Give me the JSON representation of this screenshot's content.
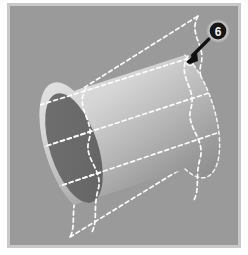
{
  "figure": {
    "caption_label": "6",
    "background_color": "#ffffff",
    "canvas_color": "#9a9a9a",
    "canvas_border_color": "#c9c9c9",
    "canvas": {
      "x": 10,
      "y": 6,
      "width": 228,
      "height": 239
    }
  },
  "colors": {
    "page_background": "#ffffff",
    "plot_background": "#9a9a9a",
    "cylinder_cap_dark": "#6b6b6b",
    "cylinder_body_light": "#d8d8d8",
    "cylinder_body_mid": "#b4b4b4",
    "cylinder_body_dark": "#8c8c8c",
    "dashed_line": "#fdfdfd",
    "arrow": "#101010",
    "badge_fill": "#161616",
    "badge_halo": "#e8e8e8",
    "badge_text": "#f2f2f2",
    "marker_fill": "#8a8a8a",
    "marker_stroke": "#ffffff"
  },
  "geometry": {
    "cylinder": {
      "axis_angle_deg": -18,
      "left_cap_center": {
        "x": 74,
        "y": 148
      },
      "right_cap_center": {
        "x": 185,
        "y": 112
      },
      "cap_radius_x": 24,
      "cap_radius_y": 57
    },
    "contour_bands": 4,
    "wavy_curves": 2
  },
  "annotations": {
    "callout": {
      "label": "6",
      "badge_center": {
        "x": 218,
        "y": 31
      },
      "badge_radius": 9,
      "arrow_from": {
        "x": 208,
        "y": 40
      },
      "arrow_to": {
        "x": 189,
        "y": 58
      }
    },
    "marker": {
      "name": "contour-point-marker",
      "center": {
        "x": 190,
        "y": 62
      },
      "radius": 3
    }
  },
  "legend": {
    "dashed_meaning": "projected / hidden contour bands",
    "solid_meaning": "visible cylinder surface"
  }
}
